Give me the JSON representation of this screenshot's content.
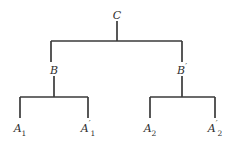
{
  "figure": {
    "type": "tree-diagram",
    "title": "",
    "background_color": "#ffffff",
    "line_color": "#3a3a3a",
    "text_color": "#2f2f2f",
    "nodes": [
      {
        "id": "root",
        "base": "C",
        "prime": "",
        "sub": "",
        "x": 117,
        "y": 14
      },
      {
        "id": "left",
        "base": "B",
        "prime": "",
        "sub": "",
        "x": 54,
        "y": 69
      },
      {
        "id": "right",
        "base": "B",
        "prime": "′",
        "sub": "",
        "x": 182,
        "y": 69
      },
      {
        "id": "leaf-a1",
        "base": "A",
        "prime": "",
        "sub": "1",
        "x": 20,
        "y": 128
      },
      {
        "id": "leaf-a1p",
        "base": "A",
        "prime": "′",
        "sub": "1",
        "x": 88,
        "y": 128
      },
      {
        "id": "leaf-a2",
        "base": "A",
        "prime": "",
        "sub": "2",
        "x": 150,
        "y": 128
      },
      {
        "id": "leaf-a2p",
        "base": "A",
        "prime": "′",
        "sub": "2",
        "x": 215,
        "y": 128
      }
    ],
    "connectors": {
      "root_stem": {
        "x": 117,
        "y1": 21,
        "y2": 41
      },
      "top_bar": {
        "x1": 51,
        "x2": 182,
        "y": 41
      },
      "top_drop_left": {
        "x": 51,
        "y1": 41,
        "y2": 62
      },
      "top_drop_right": {
        "x": 182,
        "y1": 41,
        "y2": 62
      },
      "left_stem": {
        "x": 54,
        "y1": 76,
        "y2": 97
      },
      "left_bar": {
        "x1": 20,
        "x2": 88,
        "y": 97
      },
      "left_drop_a1": {
        "x": 20,
        "y1": 97,
        "y2": 118
      },
      "left_drop_a1p": {
        "x": 88,
        "y1": 97,
        "y2": 118
      },
      "right_stem": {
        "x": 182,
        "y1": 76,
        "y2": 97
      },
      "right_bar": {
        "x1": 150,
        "x2": 215,
        "y": 97
      },
      "right_drop_a2": {
        "x": 150,
        "y1": 97,
        "y2": 118
      },
      "right_drop_a2p": {
        "x": 215,
        "y1": 97,
        "y2": 118
      }
    }
  }
}
